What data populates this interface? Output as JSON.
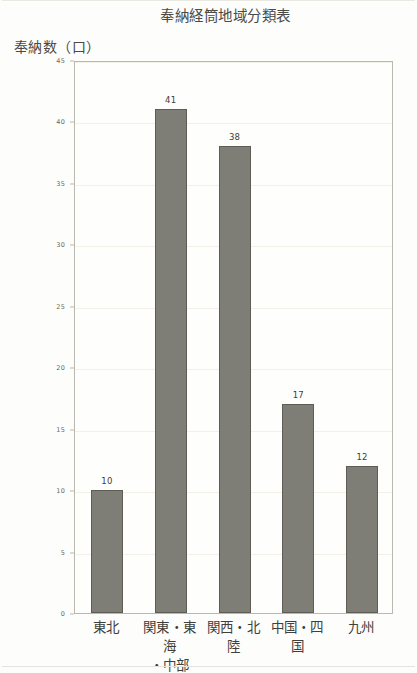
{
  "chart_data": {
    "type": "bar",
    "title": "奉納経筒地域分類表",
    "ylabel": "奉納数（口）",
    "xlabel": "",
    "categories": [
      "東北",
      "関東・東海・中部",
      "関西・北陸",
      "中国・四国",
      "九州"
    ],
    "category_lines": [
      [
        "東北"
      ],
      [
        "関東・東海",
        "・中部"
      ],
      [
        "関西・北陸"
      ],
      [
        "中国・四国"
      ],
      [
        "九州"
      ]
    ],
    "values": [
      10,
      41,
      38,
      17,
      12
    ],
    "value_labels": [
      "10",
      "41",
      "38",
      "17",
      "12"
    ],
    "ylim": [
      0,
      45
    ],
    "ytick_values": [
      0,
      5,
      10,
      15,
      20,
      25,
      30,
      35,
      40,
      45
    ],
    "ytick_labels": [
      "0",
      "5",
      "10",
      "15",
      "20",
      "25",
      "30",
      "35",
      "40",
      "45"
    ],
    "grid": true,
    "legend": false,
    "bar_color": "#7e7e76",
    "bar_edge_color": "#5d5d56",
    "frame_color": "#b9b9ae",
    "text_color": "#3f3f3b",
    "background": "#fdfdfb"
  }
}
